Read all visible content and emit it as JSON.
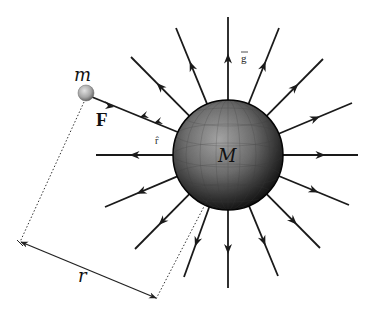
{
  "diagram": {
    "labels": {
      "large_mass": "M",
      "small_mass": "m",
      "force": "F",
      "unit_vector": "r̂",
      "field": "g",
      "distance": "r"
    },
    "colors": {
      "background": "#ffffff",
      "line": "#1a1a1a",
      "sphere_light": "#9a9a9a",
      "sphere_dark": "#0d0d0d",
      "small_sphere_light": "#d8d8d8",
      "small_sphere_dark": "#6e6e6e",
      "dashed": "#333333"
    },
    "large_sphere": {
      "cx": 228,
      "cy": 155,
      "r": 55
    },
    "small_sphere": {
      "cx": 86,
      "cy": 93,
      "r": 8
    },
    "field_rays": [
      {
        "name": "ray-up",
        "x2": 228,
        "y2": 17,
        "direction": "outward"
      },
      {
        "name": "ray-up-right-1",
        "x2": 279,
        "y2": 28,
        "direction": "outward"
      },
      {
        "name": "ray-up-right-2",
        "x2": 323,
        "y2": 59,
        "direction": "outward"
      },
      {
        "name": "ray-right-up",
        "x2": 352,
        "y2": 103,
        "direction": "outward"
      },
      {
        "name": "ray-right",
        "x2": 358,
        "y2": 155,
        "direction": "outward"
      },
      {
        "name": "ray-right-down",
        "x2": 349,
        "y2": 205,
        "direction": "outward"
      },
      {
        "name": "ray-down-right-2",
        "x2": 320,
        "y2": 248,
        "direction": "outward"
      },
      {
        "name": "ray-down-right-1",
        "x2": 278,
        "y2": 276,
        "direction": "outward"
      },
      {
        "name": "ray-down",
        "x2": 228,
        "y2": 288,
        "direction": "outward"
      },
      {
        "name": "ray-down-left-1",
        "x2": 184,
        "y2": 277,
        "direction": "outward"
      },
      {
        "name": "ray-down-left-2",
        "x2": 135,
        "y2": 249,
        "direction": "outward"
      },
      {
        "name": "ray-left-down",
        "x2": 105,
        "y2": 207,
        "direction": "outward"
      },
      {
        "name": "ray-left",
        "x2": 96,
        "y2": 155,
        "direction": "outward"
      },
      {
        "name": "ray-up-left-2",
        "x2": 131,
        "y2": 57,
        "direction": "outward"
      },
      {
        "name": "ray-up-left-1",
        "x2": 176,
        "y2": 28,
        "direction": "outward"
      }
    ],
    "force_line": {
      "from": "small_mass",
      "to": "large_mass",
      "arrowheads": 3
    },
    "distance_marker": {
      "p1": {
        "x": 20,
        "y": 242
      },
      "p2": {
        "x": 156,
        "y": 299
      }
    }
  }
}
